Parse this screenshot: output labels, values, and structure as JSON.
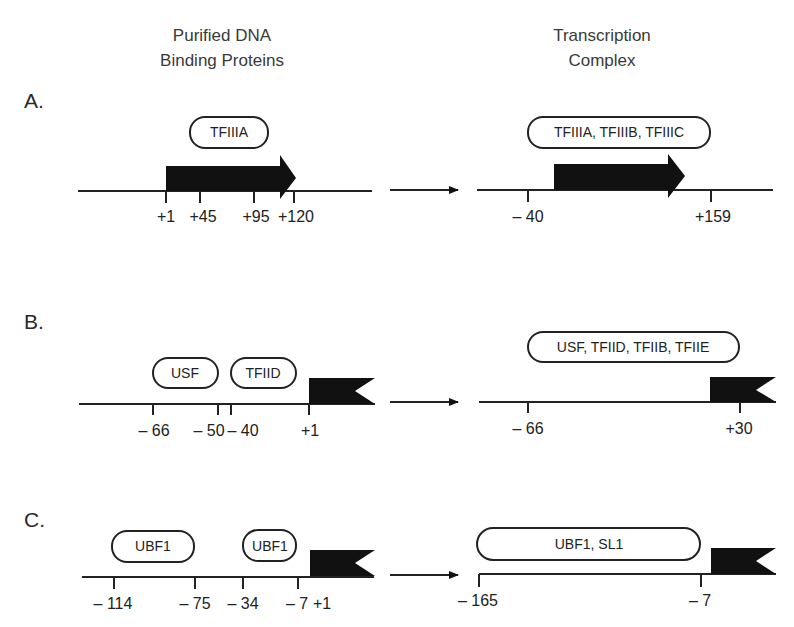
{
  "headers": {
    "left": [
      "Purified DNA",
      "Binding Proteins"
    ],
    "right": [
      "Transcription",
      "Complex"
    ]
  },
  "panels": [
    {
      "label": "A.",
      "left": {
        "proteins": [
          "TFIIIA"
        ],
        "ticks": [
          "+1",
          "+45",
          "+95",
          "+120"
        ],
        "gene_element": "arrow"
      },
      "right": {
        "complex": "TFIIIA, TFIIIB, TFIIIC",
        "ticks": [
          "– 40",
          "+159"
        ],
        "gene_element": "arrow"
      }
    },
    {
      "label": "B.",
      "left": {
        "proteins": [
          "USF",
          "TFIID"
        ],
        "ticks": [
          "– 66",
          "– 50",
          "– 40",
          "+1"
        ],
        "gene_element": "flag"
      },
      "right": {
        "complex": "USF, TFIID, TFIIB, TFIIE",
        "ticks": [
          "– 66",
          "+30"
        ],
        "gene_element": "flag"
      }
    },
    {
      "label": "C.",
      "left": {
        "proteins": [
          "UBF1",
          "UBF1"
        ],
        "ticks": [
          "– 114",
          "– 75",
          "– 34",
          "– 7",
          "+1"
        ],
        "gene_element": "flag"
      },
      "right": {
        "complex": "UBF1, SL1",
        "ticks": [
          "– 165",
          "– 7"
        ],
        "gene_element": "flag"
      }
    }
  ]
}
